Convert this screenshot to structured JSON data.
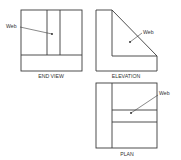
{
  "views": {
    "end_view": {
      "caption": "END VIEW",
      "label": "Web"
    },
    "elevation": {
      "caption": "ELEVATION",
      "label": "Web"
    },
    "plan": {
      "caption": "PLAN",
      "label": "Web"
    }
  },
  "colors": {
    "line": "#3a3a3a",
    "text": "#333333",
    "background": "#ffffff"
  }
}
